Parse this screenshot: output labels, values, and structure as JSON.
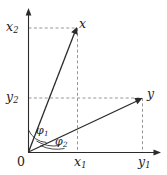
{
  "figure": {
    "type": "vector-diagram",
    "background_color": "#ffffff",
    "line_color": "#2b2b2b",
    "dash_color": "#8a8a8a"
  },
  "axes": {
    "vertical": {
      "name": "vertical-axis",
      "top_label": "x",
      "top_label_sub": "2",
      "origin_px": [
        28,
        152
      ],
      "tip_px": [
        28,
        9
      ]
    },
    "horizontal": {
      "name": "horizontal-axis",
      "right_label": "y",
      "right_label_sub": "1",
      "origin_px": [
        28,
        152
      ],
      "tip_px": [
        161,
        152
      ]
    }
  },
  "origin": {
    "label": "0"
  },
  "vectors": [
    {
      "name": "vector-x",
      "label": "x",
      "tip_px": [
        77,
        28
      ],
      "component_labels": {
        "horizontal": {
          "text": "x",
          "sub": "1"
        },
        "vertical": {
          "text": "x",
          "sub": "2"
        }
      },
      "angle": {
        "text": "φ",
        "sub": "1"
      }
    },
    {
      "name": "vector-y",
      "label": "y",
      "tip_px": [
        142,
        98
      ],
      "component_labels": {
        "horizontal": {
          "text": "y",
          "sub": "1"
        },
        "vertical": {
          "text": "y",
          "sub": "2"
        }
      },
      "angle": {
        "text": "φ",
        "sub": "2"
      }
    }
  ],
  "labels": {
    "x2": {
      "text": "x",
      "sub": "2"
    },
    "y2": {
      "text": "y",
      "sub": "2"
    },
    "x1": {
      "text": "x",
      "sub": "1"
    },
    "y1": {
      "text": "y",
      "sub": "1"
    },
    "x_pt": {
      "text": "x",
      "sub": ""
    },
    "y_pt": {
      "text": "y",
      "sub": ""
    },
    "phi1": {
      "text": "φ",
      "sub": "1"
    },
    "phi2": {
      "text": "φ",
      "sub": "2"
    },
    "zero": {
      "text": "0"
    }
  }
}
